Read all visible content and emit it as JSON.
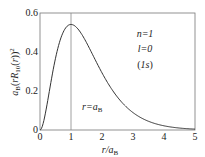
{
  "chart_data": {
    "type": "line",
    "title": "",
    "xlabel": "r/a_B",
    "ylabel": "a_B(rR_10(r))^2",
    "xlim": [
      0,
      5
    ],
    "ylim": [
      0,
      0.6
    ],
    "xticks": [
      "0",
      "1",
      "2",
      "3",
      "4",
      "5"
    ],
    "yticks": [
      "0",
      "0.2",
      "0.4",
      "0.6"
    ],
    "grid": false,
    "series": [
      {
        "name": "1s radial probability",
        "formula": "4 x^2 exp(-2x)",
        "x": [
          0,
          0.25,
          0.5,
          0.75,
          1,
          1.5,
          2,
          2.5,
          3,
          3.5,
          4,
          4.5,
          5
        ],
        "values": [
          0,
          0.152,
          0.368,
          0.502,
          0.541,
          0.448,
          0.293,
          0.168,
          0.089,
          0.045,
          0.021,
          0.01,
          0.005
        ]
      }
    ],
    "annotations": [
      "n=1",
      "l=0",
      "(1s)",
      "r=a_B"
    ],
    "vline_x": 1
  },
  "labels": {
    "xlabel_main": "r",
    "xlabel_den": "/a",
    "xlabel_sub": "B",
    "n": "n=1",
    "l": "l=0",
    "orb": "(1s)",
    "vline": "r=a",
    "vline_sub": "B",
    "y0": "0",
    "y1": "0.2",
    "y2": "0.4",
    "y3": "0.6",
    "x0": "0",
    "x1": "1",
    "x2": "2",
    "x3": "3",
    "x4": "4",
    "x5": "5"
  }
}
